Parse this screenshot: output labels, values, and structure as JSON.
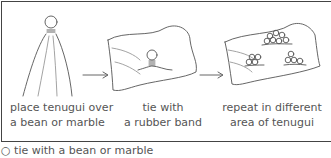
{
  "steps": [
    {
      "line1": "place tenugui over",
      "line2": "a bean or marble",
      "illustration": "tenugui-draped-over-bean"
    },
    {
      "line1": "tie with",
      "line2": "a rubber band",
      "illustration": "tenugui-tied-bean"
    },
    {
      "line1": "repeat in different",
      "line2": "area of tenugui",
      "illustration": "tenugui-multiple-ties"
    }
  ],
  "arrows": [
    "arrow-right",
    "arrow-right"
  ],
  "caption": "○ tie with a bean or marble"
}
